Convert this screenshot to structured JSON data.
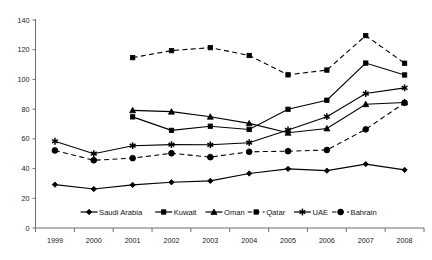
{
  "chart_data": {
    "type": "line",
    "title": "",
    "subtitle": "",
    "xlabel": "",
    "ylabel": "",
    "categories": [
      "1999",
      "2000",
      "2001",
      "2002",
      "2003",
      "2004",
      "2005",
      "2006",
      "2007",
      "2008"
    ],
    "x": [
      1999,
      2000,
      2001,
      2002,
      2003,
      2004,
      2005,
      2006,
      2007,
      2008
    ],
    "ylim": [
      0,
      140
    ],
    "yticks": [
      0,
      20,
      40,
      60,
      80,
      100,
      120,
      140
    ],
    "ytick_labels": [
      "0",
      "20",
      "40",
      "60",
      "80",
      "100",
      "120",
      "140"
    ],
    "grid": false,
    "legend_position": "bottom",
    "series": [
      {
        "name": "Saudi Arabia",
        "marker": "diamond",
        "linestyle": "solid",
        "color": "#000000",
        "values": [
          29.2,
          26.2,
          29.0,
          30.8,
          31.7,
          36.7,
          39.8,
          38.6,
          43.0,
          39.1
        ]
      },
      {
        "name": "Kuwait",
        "marker": "square",
        "linestyle": "solid",
        "color": "#000000",
        "values": [
          null,
          null,
          74.8,
          65.7,
          68.5,
          66.3,
          79.9,
          86.0,
          111.0,
          103.0
        ]
      },
      {
        "name": "Oman",
        "marker": "triangle",
        "linestyle": "solid",
        "color": "#000000",
        "values": [
          null,
          null,
          79.2,
          78.3,
          74.9,
          70.4,
          64.1,
          67.0,
          83.3,
          84.5
        ]
      },
      {
        "name": "Qatar",
        "marker": "square",
        "linestyle": "dashed",
        "color": "#000000",
        "values": [
          null,
          null,
          114.7,
          119.4,
          121.4,
          116.1,
          103.1,
          106.3,
          129.5,
          110.9
        ]
      },
      {
        "name": "UAE",
        "marker": "asterisk",
        "linestyle": "solid",
        "color": "#000000",
        "values": [
          58.4,
          50.0,
          55.4,
          56.1,
          56.0,
          57.4,
          66.0,
          74.9,
          90.5,
          94.3
        ]
      },
      {
        "name": "Bahrain",
        "marker": "circle",
        "linestyle": "dashed",
        "color": "#000000",
        "values": [
          52.2,
          45.6,
          47.0,
          50.3,
          47.7,
          51.3,
          51.7,
          52.5,
          66.4,
          84.3
        ]
      }
    ]
  },
  "legend": {
    "items": [
      {
        "label": "Saudi Arabia"
      },
      {
        "label": "Kuwait"
      },
      {
        "label": "Oman"
      },
      {
        "label": "Qatar"
      },
      {
        "label": "UAE"
      },
      {
        "label": "Bahrain"
      }
    ]
  },
  "caption": {
    "text": ""
  }
}
